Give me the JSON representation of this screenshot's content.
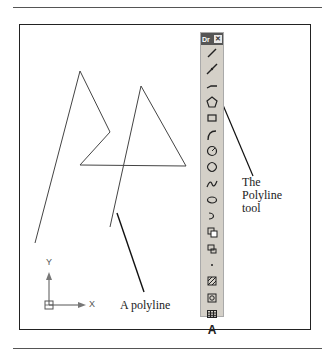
{
  "figure": {
    "polyline_label": "A polyline",
    "tool_label_lines": [
      "The",
      "Polyline",
      "tool"
    ],
    "ucs": {
      "x_label": "X",
      "y_label": "Y"
    }
  },
  "toolbar": {
    "title": "Dr",
    "close_glyph": "✕",
    "tools": [
      {
        "name": "line-icon"
      },
      {
        "name": "construction-line-icon"
      },
      {
        "name": "polyline-icon"
      },
      {
        "name": "polygon-icon"
      },
      {
        "name": "rectangle-icon"
      },
      {
        "name": "arc-icon"
      },
      {
        "name": "circle-icon"
      },
      {
        "name": "revision-cloud-icon"
      },
      {
        "name": "spline-icon"
      },
      {
        "name": "ellipse-icon"
      },
      {
        "name": "ellipse-arc-icon"
      },
      {
        "name": "insert-block-icon"
      },
      {
        "name": "make-block-icon"
      },
      {
        "name": "point-icon"
      },
      {
        "name": "hatch-icon"
      },
      {
        "name": "region-icon"
      },
      {
        "name": "table-icon"
      },
      {
        "name": "multiline-text-icon",
        "glyph": "A"
      }
    ]
  }
}
